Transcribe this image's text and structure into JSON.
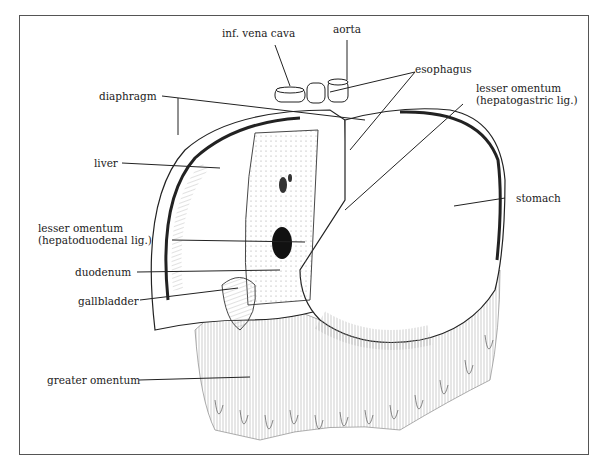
{
  "diagram": {
    "type": "anatomical-illustration",
    "labels": {
      "inf_vena_cava": "inf. vena cava",
      "aorta": "aorta",
      "esophagus": "esophagus",
      "diaphragm": "diaphragm",
      "lesser_omentum_hg_1": "lesser omentum",
      "lesser_omentum_hg_2": "(hepatogastric lig.)",
      "liver": "liver",
      "stomach": "stomach",
      "lesser_omentum_hd_1": "lesser omentum",
      "lesser_omentum_hd_2": "(hepatoduodenal lig.)",
      "duodenum": "duodenum",
      "gallbladder": "gallbladder",
      "greater_omentum": "greater omentum"
    },
    "colors": {
      "line": "#222222",
      "frame": "#555555",
      "background": "#ffffff"
    }
  }
}
